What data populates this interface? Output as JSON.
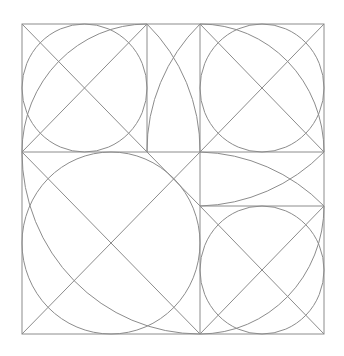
{
  "diagram": {
    "width": 344,
    "height": 356,
    "background": "#ffffff",
    "stroke_color": "#8c8c8c",
    "stroke_width": 1,
    "outer_square": {
      "x1": 22,
      "y1": 24,
      "x2": 324,
      "y2": 334
    },
    "grid_lines": [
      {
        "name": "vertical-divider-left",
        "x1": 147,
        "y1": 24,
        "x2": 147,
        "y2": 152
      },
      {
        "name": "vertical-divider-right",
        "x1": 200,
        "y1": 24,
        "x2": 200,
        "y2": 334
      },
      {
        "name": "horizontal-divider-middle",
        "x1": 22,
        "y1": 152,
        "x2": 324,
        "y2": 152
      },
      {
        "name": "horizontal-divider-lower-right",
        "x1": 200,
        "y1": 206,
        "x2": 324,
        "y2": 206
      }
    ],
    "squares": [
      {
        "name": "top-left-square",
        "x1": 22,
        "y1": 24,
        "x2": 147,
        "y2": 152,
        "inscribed_circle": true,
        "diagonals": true,
        "quarter_arc": {
          "from": [
            22,
            152
          ],
          "to": [
            147,
            24
          ],
          "center": [
            147,
            152
          ],
          "r": 126,
          "sweep": 1
        }
      },
      {
        "name": "top-right-square",
        "x1": 200,
        "y1": 24,
        "x2": 324,
        "y2": 152,
        "inscribed_circle": true,
        "diagonals": true,
        "quarter_arc": {
          "from": [
            200,
            24
          ],
          "to": [
            324,
            152
          ],
          "center": [
            200,
            152
          ],
          "r": 126,
          "sweep": 1
        }
      },
      {
        "name": "bottom-left-square",
        "x1": 22,
        "y1": 152,
        "x2": 200,
        "y2": 334,
        "inscribed_circle": true,
        "diagonals": true,
        "quarter_arc": {
          "from": [
            22,
            152
          ],
          "to": [
            200,
            334
          ],
          "center": [
            200,
            152
          ],
          "r": 180,
          "sweep": 0
        }
      },
      {
        "name": "bottom-right-square",
        "x1": 200,
        "y1": 206,
        "x2": 324,
        "y2": 334,
        "inscribed_circle": true,
        "diagonals": true,
        "quarter_arc": {
          "from": [
            200,
            334
          ],
          "to": [
            324,
            206
          ],
          "center": [
            200,
            206
          ],
          "r": 126,
          "sweep": 0
        }
      }
    ],
    "extra_lines": [
      {
        "name": "outer-diagonal-segment",
        "x1": 147,
        "y1": 152,
        "x2": 200,
        "y2": 206
      }
    ],
    "strip_arcs": [
      {
        "name": "middle-strip-arc-a",
        "from": [
          147,
          24
        ],
        "to": [
          200,
          152
        ],
        "r": 178,
        "sweep": 1
      },
      {
        "name": "middle-strip-arc-b",
        "from": [
          200,
          24
        ],
        "to": [
          147,
          152
        ],
        "r": 178,
        "sweep": 0
      },
      {
        "name": "right-strip-arc-a",
        "from": [
          200,
          152
        ],
        "to": [
          324,
          206
        ],
        "r": 180,
        "sweep": 1
      },
      {
        "name": "right-strip-arc-b",
        "from": [
          200,
          206
        ],
        "to": [
          324,
          152
        ],
        "r": 180,
        "sweep": 0
      }
    ]
  }
}
